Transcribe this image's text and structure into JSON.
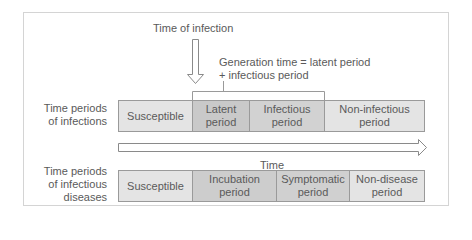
{
  "diagram": {
    "top_label": "Time of infection",
    "generation_note_line1": "Generation time = latent period",
    "generation_note_line2": "+ infectious period",
    "time_axis_label": "Time",
    "rows": [
      {
        "label_line1": "Time periods",
        "label_line2": "of infections",
        "label_line3": "",
        "cells": [
          {
            "line1": "Susceptible",
            "line2": "",
            "color": "#e4e4e4",
            "width": 74
          },
          {
            "line1": "Latent",
            "line2": "period",
            "color": "#c9c9c9",
            "width": 57
          },
          {
            "line1": "Infectious",
            "line2": "period",
            "color": "#d2d2d2",
            "width": 75
          },
          {
            "line1": "Non-infectious",
            "line2": "period",
            "color": "#e4e4e4",
            "width": 101
          }
        ]
      },
      {
        "label_line1": "Time periods",
        "label_line2": "of infectious",
        "label_line3": "diseases",
        "cells": [
          {
            "line1": "Susceptible",
            "line2": "",
            "color": "#e4e4e4",
            "width": 74
          },
          {
            "line1": "Incubation",
            "line2": "period",
            "color": "#cdcdcd",
            "width": 84
          },
          {
            "line1": "Symptomatic",
            "line2": "period",
            "color": "#d0d0d0",
            "width": 73
          },
          {
            "line1": "Non-disease",
            "line2": "period",
            "color": "#e4e4e4",
            "width": 76
          }
        ]
      }
    ]
  }
}
